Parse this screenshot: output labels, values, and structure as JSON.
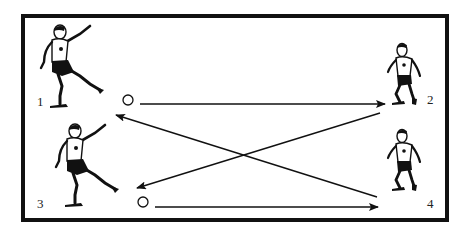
{
  "diagram": {
    "type": "soccer passing drill",
    "border_color": "#111111",
    "ink_color": "#111111",
    "players": [
      {
        "id": "1",
        "label": "1",
        "position": "top-left",
        "action": "kicking"
      },
      {
        "id": "2",
        "label": "2",
        "position": "top-right",
        "action": "running"
      },
      {
        "id": "3",
        "label": "3",
        "position": "bottom-left",
        "action": "kicking"
      },
      {
        "id": "4",
        "label": "4",
        "position": "bottom-right",
        "action": "running"
      }
    ],
    "balls": [
      {
        "id": "ball-1",
        "near_player": "1"
      },
      {
        "id": "ball-3",
        "near_player": "3"
      }
    ],
    "arrows": [
      {
        "from": "ball-1",
        "to": "2",
        "style": "straight"
      },
      {
        "from": "ball-3",
        "to": "4",
        "style": "straight"
      },
      {
        "from": "2",
        "to": "3",
        "style": "diagonal"
      },
      {
        "from": "4",
        "to": "1",
        "style": "diagonal"
      }
    ]
  }
}
